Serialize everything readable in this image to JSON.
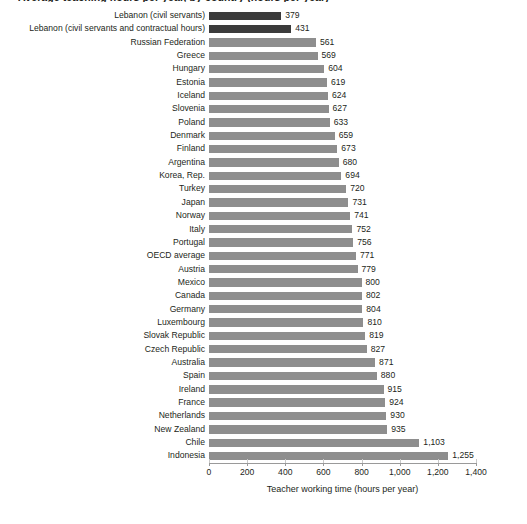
{
  "chart_title": "Average teaching hours per year, by country (hours per year)",
  "chart_data": {
    "type": "bar",
    "orientation": "horizontal",
    "title": "Average teaching hours per year, by country (hours per year)",
    "xlabel": "Teacher working time (hours per year)",
    "ylabel": "",
    "xlim": [
      0,
      1400
    ],
    "xticks": [
      0,
      200,
      400,
      600,
      800,
      1000,
      1200,
      1400
    ],
    "xtick_labels": [
      "0",
      "200",
      "400",
      "600",
      "800",
      "1,000",
      "1,200",
      "1,400"
    ],
    "grid": false,
    "legend": "none",
    "colors": {
      "default_bar": "#8e8e8e",
      "highlight_bar": "#3b3b3b"
    },
    "categories": [
      "Lebanon (civil servants)",
      "Lebanon (civil servants and contractual hours)",
      "Russian Federation",
      "Greece",
      "Hungary",
      "Estonia",
      "Iceland",
      "Slovenia",
      "Poland",
      "Denmark",
      "Finland",
      "Argentina",
      "Korea, Rep.",
      "Turkey",
      "Japan",
      "Norway",
      "Italy",
      "Portugal",
      "OECD average",
      "Austria",
      "Mexico",
      "Canada",
      "Germany",
      "Luxembourg",
      "Slovak Republic",
      "Czech Republic",
      "Australia",
      "Spain",
      "Ireland",
      "France",
      "Netherlands",
      "New Zealand",
      "Chile",
      "Indonesia"
    ],
    "values": [
      379,
      431,
      561,
      569,
      604,
      619,
      624,
      627,
      633,
      659,
      673,
      680,
      694,
      720,
      731,
      741,
      752,
      756,
      771,
      779,
      800,
      802,
      804,
      810,
      819,
      827,
      871,
      880,
      915,
      924,
      930,
      935,
      1103,
      1255
    ],
    "value_labels": [
      "379",
      "431",
      "561",
      "569",
      "604",
      "619",
      "624",
      "627",
      "633",
      "659",
      "673",
      "680",
      "694",
      "720",
      "731",
      "741",
      "752",
      "756",
      "771",
      "779",
      "800",
      "802",
      "804",
      "810",
      "819",
      "827",
      "871",
      "880",
      "915",
      "924",
      "930",
      "935",
      "1,103",
      "1,255"
    ],
    "highlighted": [
      true,
      true,
      false,
      false,
      false,
      false,
      false,
      false,
      false,
      false,
      false,
      false,
      false,
      false,
      false,
      false,
      false,
      false,
      false,
      false,
      false,
      false,
      false,
      false,
      false,
      false,
      false,
      false,
      false,
      false,
      false,
      false,
      false,
      false
    ]
  }
}
